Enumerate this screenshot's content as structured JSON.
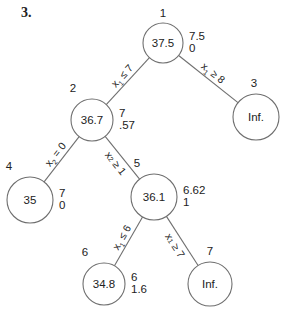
{
  "problem_number": "3.",
  "tree": {
    "nodes": [
      {
        "id": "1",
        "value": "37.5",
        "side": [
          "7.5",
          "0"
        ]
      },
      {
        "id": "2",
        "value": "36.7",
        "side": [
          "7",
          ".57"
        ]
      },
      {
        "id": "3",
        "value": "Inf.",
        "side": []
      },
      {
        "id": "4",
        "value": "35",
        "side": [
          "7",
          "0"
        ]
      },
      {
        "id": "5",
        "value": "36.1",
        "side": [
          "6.62",
          "1"
        ]
      },
      {
        "id": "6",
        "value": "34.8",
        "side": [
          "6",
          "1.6"
        ]
      },
      {
        "id": "7",
        "value": "Inf.",
        "side": []
      }
    ],
    "edges": [
      {
        "from": "1",
        "to": "2",
        "var": "x",
        "sub": "1",
        "op": "≤",
        "rhs": "7"
      },
      {
        "from": "1",
        "to": "3",
        "var": "x",
        "sub": "1",
        "op": "≥",
        "rhs": "8"
      },
      {
        "from": "2",
        "to": "4",
        "var": "x",
        "sub": "2",
        "op": "=",
        "rhs": "0"
      },
      {
        "from": "2",
        "to": "5",
        "var": "x",
        "sub": "2",
        "op": "≥",
        "rhs": "1"
      },
      {
        "from": "5",
        "to": "6",
        "var": "x",
        "sub": "1",
        "op": "≤",
        "rhs": "6"
      },
      {
        "from": "5",
        "to": "7",
        "var": "x",
        "sub": "1",
        "op": "≥",
        "rhs": "7"
      }
    ]
  }
}
